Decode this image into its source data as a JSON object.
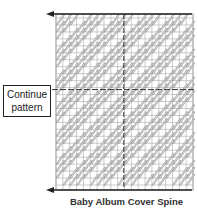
{
  "diagram": {
    "title": "Baby Album Cover Spine",
    "label": {
      "line1": "Continue",
      "line2": "pattern"
    },
    "grid": {
      "left": 56,
      "top": 18,
      "right": 193,
      "bottom": 185,
      "cols": 20,
      "rows": 24,
      "center_col": 9,
      "dash_row": 10
    },
    "arrows": [
      {
        "name": "top-left-arrow",
        "y": 14,
        "x_from": 192,
        "x_to": 46
      },
      {
        "name": "bottom-left-arrow",
        "y": 190,
        "x_from": 192,
        "x_to": 46
      }
    ],
    "colors": {
      "grid": "#b5b5b5",
      "stitch": "#8a8a8a",
      "stitch_fill": "#e3e3e3",
      "dash": "#333333",
      "arrow": "#222222"
    }
  }
}
